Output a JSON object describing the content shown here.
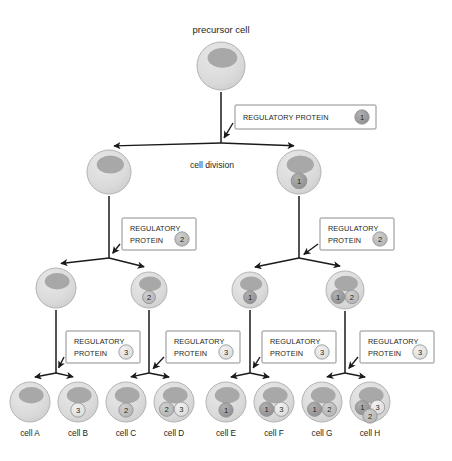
{
  "figure": {
    "title_label": "precursor cell",
    "division_label": "cell division",
    "protein_label_line1": "REGULATORY",
    "protein_label_line2": "PROTEIN",
    "protein_label_single": "REGULATORY PROTEIN"
  },
  "colors": {
    "cell_fill": "#dcdcdc",
    "cell_stroke": "#b4b4b4",
    "nucleus_fill": "#a8a8a8",
    "badge_1_fill": "#9a9a9a",
    "badge_2_fill": "#bdbdbd",
    "badge_3_fill": "#e2e2e2",
    "badge_stroke": "#8f8f8f",
    "line": "#1a1a1a",
    "box_stroke": "#8d8d8d",
    "text": "#231f20"
  },
  "generations": [
    {
      "name": "generation-0",
      "cells": [
        {
          "id": "precursor",
          "label": "precursor cell",
          "badges": [],
          "cx": 221,
          "cy": 66,
          "r": 24
        }
      ]
    },
    {
      "name": "generation-1",
      "cells": [
        {
          "id": "g1-left",
          "label": "",
          "badges": [],
          "cx": 109,
          "cy": 172,
          "r": 22
        },
        {
          "id": "g1-right",
          "label": "",
          "badges": [
            "1"
          ],
          "cx": 299,
          "cy": 172,
          "r": 22
        }
      ]
    },
    {
      "name": "generation-2",
      "cells": [
        {
          "id": "g2-a",
          "label": "",
          "badges": [],
          "cx": 56,
          "cy": 288,
          "r": 20
        },
        {
          "id": "g2-b",
          "label": "",
          "badges": [
            "2"
          ],
          "cx": 149,
          "cy": 290,
          "r": 18
        },
        {
          "id": "g2-c",
          "label": "",
          "badges": [
            "1"
          ],
          "cx": 250,
          "cy": 290,
          "r": 18
        },
        {
          "id": "g2-d",
          "label": "",
          "badges": [
            "1",
            "2"
          ],
          "cx": 345,
          "cy": 290,
          "r": 19
        }
      ]
    },
    {
      "name": "generation-3",
      "cells": [
        {
          "id": "cell-a",
          "label": "cell A",
          "badges": [],
          "cx": 30,
          "cy": 402,
          "r": 20
        },
        {
          "id": "cell-b",
          "label": "cell B",
          "badges": [
            "3"
          ],
          "cx": 78,
          "cy": 402,
          "r": 20
        },
        {
          "id": "cell-c",
          "label": "cell C",
          "badges": [
            "2"
          ],
          "cx": 126,
          "cy": 402,
          "r": 20
        },
        {
          "id": "cell-d",
          "label": "cell D",
          "badges": [
            "2",
            "3"
          ],
          "cx": 174,
          "cy": 402,
          "r": 20
        },
        {
          "id": "cell-e",
          "label": "cell E",
          "badges": [
            "1"
          ],
          "cx": 226,
          "cy": 402,
          "r": 20
        },
        {
          "id": "cell-f",
          "label": "cell F",
          "badges": [
            "1",
            "3"
          ],
          "cx": 274,
          "cy": 402,
          "r": 20
        },
        {
          "id": "cell-g",
          "label": "cell G",
          "badges": [
            "1",
            "2"
          ],
          "cx": 322,
          "cy": 402,
          "r": 20
        },
        {
          "id": "cell-h",
          "label": "cell H",
          "badges": [
            "1",
            "3",
            "2"
          ],
          "cx": 370,
          "cy": 402,
          "r": 20
        }
      ]
    }
  ],
  "protein_boxes": [
    {
      "id": "protein-box-1",
      "number": "1",
      "layout": "single",
      "x": 235,
      "y": 105,
      "w": 141,
      "h": 24
    },
    {
      "id": "protein-box-2-left",
      "number": "2",
      "layout": "double",
      "x": 122,
      "y": 218,
      "w": 74,
      "h": 32
    },
    {
      "id": "protein-box-2-right",
      "number": "2",
      "layout": "double",
      "x": 320,
      "y": 218,
      "w": 74,
      "h": 32
    },
    {
      "id": "protein-box-3-a",
      "number": "3",
      "layout": "double",
      "x": 66,
      "y": 331,
      "w": 74,
      "h": 32
    },
    {
      "id": "protein-box-3-b",
      "number": "3",
      "layout": "double",
      "x": 166,
      "y": 331,
      "w": 74,
      "h": 32
    },
    {
      "id": "protein-box-3-c",
      "number": "3",
      "layout": "double",
      "x": 262,
      "y": 331,
      "w": 74,
      "h": 32
    },
    {
      "id": "protein-box-3-d",
      "number": "3",
      "layout": "double",
      "x": 360,
      "y": 331,
      "w": 74,
      "h": 32
    }
  ],
  "cell_labels": [
    "cell A",
    "cell B",
    "cell C",
    "cell D",
    "cell E",
    "cell F",
    "cell G",
    "cell H"
  ]
}
